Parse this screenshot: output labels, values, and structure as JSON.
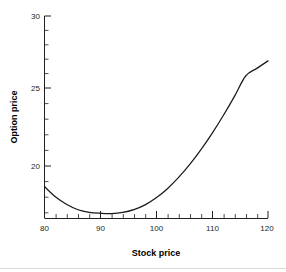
{
  "chart_data": {
    "type": "line",
    "title": "",
    "subtitle": "",
    "xlabel": "Stock price",
    "ylabel": "Option price",
    "xlim": [
      80,
      120
    ],
    "ylim": [
      16.5,
      30
    ],
    "xticks": [
      80,
      90,
      100,
      110,
      120
    ],
    "yticks": [
      20,
      25,
      30
    ],
    "xtick_labels": [
      "80",
      "90",
      "100",
      "110",
      "120"
    ],
    "ytick_labels": [
      "20",
      "25",
      "30"
    ],
    "x_minor_tick_interval": 2,
    "y_minor_tick_interval": 1,
    "grid": false,
    "legend": null,
    "annotations": [],
    "series": [
      {
        "name": "Option price",
        "color": "#1a1a1a",
        "x": [
          80,
          81,
          82,
          83,
          84,
          85,
          86,
          87,
          88,
          89,
          90,
          91,
          92,
          93,
          94,
          95,
          96,
          97,
          98,
          99,
          100,
          101,
          102,
          103,
          104,
          105,
          106,
          107,
          108,
          109,
          110,
          111,
          112,
          113,
          114,
          115,
          116,
          117,
          118,
          119,
          120
        ],
        "values": [
          18.6,
          18.2,
          17.9,
          17.6,
          17.4,
          17.2,
          17.05,
          16.95,
          16.88,
          16.84,
          16.82,
          16.81,
          16.8,
          16.82,
          16.87,
          16.95,
          17.06,
          17.2,
          17.38,
          17.6,
          17.85,
          18.14,
          18.46,
          18.82,
          19.21,
          19.63,
          20.08,
          20.56,
          21.07,
          21.6,
          22.16,
          22.74,
          23.35,
          23.98,
          24.63,
          25.3,
          25.99,
          26.7,
          27.43,
          28.18,
          27.0
        ]
      }
    ],
    "curve_points": [
      [
        80,
        18.6
      ],
      [
        82,
        17.9
      ],
      [
        84,
        17.4
      ],
      [
        86,
        17.05
      ],
      [
        88,
        16.88
      ],
      [
        90,
        16.82
      ],
      [
        92,
        16.8
      ],
      [
        94,
        16.87
      ],
      [
        96,
        17.06
      ],
      [
        98,
        17.38
      ],
      [
        100,
        17.85
      ],
      [
        102,
        18.46
      ],
      [
        104,
        19.21
      ],
      [
        106,
        20.08
      ],
      [
        108,
        21.07
      ],
      [
        110,
        22.16
      ],
      [
        112,
        23.35
      ],
      [
        114,
        24.63
      ],
      [
        116,
        25.99
      ],
      [
        118,
        26.5
      ],
      [
        120,
        27.0
      ]
    ],
    "minimum_point": {
      "x": 92,
      "y": 16.8
    },
    "endpoints": {
      "left": {
        "x": 80,
        "y": 18.6
      },
      "right": {
        "x": 120,
        "y": 27.0
      }
    },
    "colors": {
      "curve": "#1a1a1a",
      "axis": "#231f20",
      "background": "#ffffff"
    }
  }
}
